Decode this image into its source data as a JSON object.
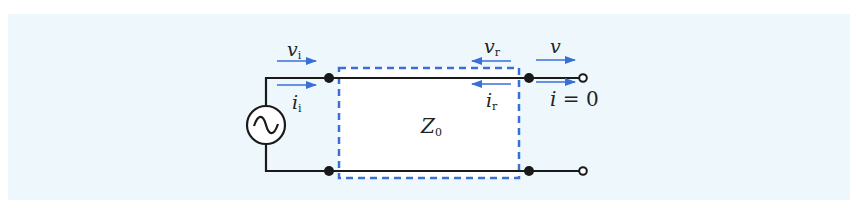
{
  "figure": {
    "background_color": "#eef8fc",
    "wire_color": "#1a1a1a",
    "accent_color": "#3a6fd8",
    "source": {
      "type": "ac-voltage-source",
      "symbol": "~"
    },
    "transmission_line": {
      "label_main": "Z",
      "label_sub": "0"
    },
    "labels": {
      "incident_voltage": {
        "main": "v",
        "sub": "i"
      },
      "incident_current": {
        "main": "i",
        "sub": "i"
      },
      "reflected_voltage": {
        "main": "v",
        "sub": "r"
      },
      "reflected_current": {
        "main": "i",
        "sub": "r"
      },
      "output_voltage": {
        "main": "v"
      },
      "output_current": {
        "main": "i",
        "eq": " = 0"
      }
    },
    "arrows": [
      {
        "name": "incident-voltage-arrow",
        "direction": "right"
      },
      {
        "name": "incident-current-arrow",
        "direction": "right"
      },
      {
        "name": "reflected-voltage-arrow",
        "direction": "left"
      },
      {
        "name": "reflected-current-arrow",
        "direction": "left"
      },
      {
        "name": "output-voltage-arrow",
        "direction": "right"
      },
      {
        "name": "output-current-arrow",
        "direction": "right"
      }
    ],
    "terminals": {
      "output": "open-circuit"
    }
  }
}
